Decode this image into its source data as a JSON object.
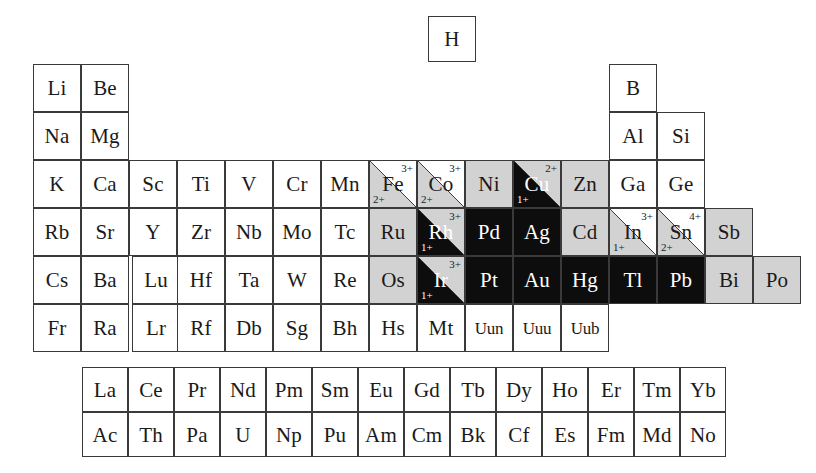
{
  "figure": {
    "kind": "periodic-table",
    "colors": {
      "white": "#ffffff",
      "gray": "#d2d2d2",
      "black": "#0d0d0d",
      "border": "#3a3a3a"
    },
    "legend_note": "Cells split on the diagonal show two oxidation states: upper-right label and lower-left label"
  },
  "geometry": {
    "cell_w": 48,
    "cell_h": 48,
    "col_x": [
      33,
      81,
      129,
      177,
      225,
      273,
      321,
      369,
      417,
      465,
      513,
      561,
      609,
      657,
      705,
      753
    ],
    "row_y": [
      64,
      112,
      160,
      208,
      256,
      304
    ],
    "lanth_x0": 82,
    "lanth_y0": 367,
    "lanth_cell_w": 46,
    "lanth_cell_h": 45,
    "hydrogen": {
      "x": 428,
      "y": 16,
      "w": 48,
      "h": 46
    }
  },
  "hydrogen": {
    "symbol": "H",
    "fill": "white"
  },
  "rows": [
    {
      "id": "row-2",
      "y_index": 0,
      "cells": [
        {
          "symbol": "Li",
          "col": 0,
          "fill": "white"
        },
        {
          "symbol": "Be",
          "col": 1,
          "fill": "white"
        },
        {
          "symbol": "B",
          "col": 12,
          "fill": "white"
        }
      ]
    },
    {
      "id": "row-3",
      "y_index": 1,
      "cells": [
        {
          "symbol": "Na",
          "col": 0,
          "fill": "white"
        },
        {
          "symbol": "Mg",
          "col": 1,
          "fill": "white"
        },
        {
          "symbol": "Al",
          "col": 12,
          "fill": "white"
        },
        {
          "symbol": "Si",
          "col": 13,
          "fill": "white"
        }
      ]
    },
    {
      "id": "row-4",
      "y_index": 2,
      "cells": [
        {
          "symbol": "K",
          "col": 0,
          "fill": "white"
        },
        {
          "symbol": "Ca",
          "col": 1,
          "fill": "white"
        },
        {
          "symbol": "Sc",
          "col": 2,
          "fill": "white"
        },
        {
          "symbol": "Ti",
          "col": 3,
          "fill": "white"
        },
        {
          "symbol": "V",
          "col": 4,
          "fill": "white"
        },
        {
          "symbol": "Cr",
          "col": 5,
          "fill": "white"
        },
        {
          "symbol": "Mn",
          "col": 6,
          "fill": "white"
        },
        {
          "symbol": "Fe",
          "col": 7,
          "fill": "split",
          "lower_fill": "gray",
          "upper_fill": "white",
          "charge_upper": "3+",
          "charge_lower": "2+"
        },
        {
          "symbol": "Co",
          "col": 8,
          "fill": "split",
          "lower_fill": "gray",
          "upper_fill": "white",
          "charge_upper": "3+",
          "charge_lower": "2+"
        },
        {
          "symbol": "Ni",
          "col": 9,
          "fill": "gray"
        },
        {
          "symbol": "Cu",
          "col": 10,
          "fill": "split",
          "lower_fill": "black",
          "upper_fill": "gray",
          "charge_upper": "2+",
          "charge_lower": "1+"
        },
        {
          "symbol": "Zn",
          "col": 11,
          "fill": "gray"
        },
        {
          "symbol": "Ga",
          "col": 12,
          "fill": "white"
        },
        {
          "symbol": "Ge",
          "col": 13,
          "fill": "white"
        }
      ]
    },
    {
      "id": "row-5",
      "y_index": 3,
      "cells": [
        {
          "symbol": "Rb",
          "col": 0,
          "fill": "white"
        },
        {
          "symbol": "Sr",
          "col": 1,
          "fill": "white"
        },
        {
          "symbol": "Y",
          "col": 2,
          "fill": "white"
        },
        {
          "symbol": "Zr",
          "col": 3,
          "fill": "white"
        },
        {
          "symbol": "Nb",
          "col": 4,
          "fill": "white"
        },
        {
          "symbol": "Mo",
          "col": 5,
          "fill": "white"
        },
        {
          "symbol": "Tc",
          "col": 6,
          "fill": "white"
        },
        {
          "symbol": "Ru",
          "col": 7,
          "fill": "gray"
        },
        {
          "symbol": "Rh",
          "col": 8,
          "fill": "split",
          "lower_fill": "black",
          "upper_fill": "gray",
          "charge_upper": "3+",
          "charge_lower": "1+"
        },
        {
          "symbol": "Pd",
          "col": 9,
          "fill": "black"
        },
        {
          "symbol": "Ag",
          "col": 10,
          "fill": "black"
        },
        {
          "symbol": "Cd",
          "col": 11,
          "fill": "gray"
        },
        {
          "symbol": "In",
          "col": 12,
          "fill": "split",
          "lower_fill": "gray",
          "upper_fill": "white",
          "charge_upper": "3+",
          "charge_lower": "1+"
        },
        {
          "symbol": "Sn",
          "col": 13,
          "fill": "split",
          "lower_fill": "gray",
          "upper_fill": "white",
          "charge_upper": "4+",
          "charge_lower": "2+"
        },
        {
          "symbol": "Sb",
          "col": 14,
          "fill": "gray"
        }
      ]
    },
    {
      "id": "row-6",
      "y_index": 4,
      "cells": [
        {
          "symbol": "Cs",
          "col": 0,
          "fill": "white"
        },
        {
          "symbol": "Ba",
          "col": 1,
          "fill": "white"
        },
        {
          "symbol": "Lu",
          "col": 2,
          "fill": "white",
          "gap_before": true
        },
        {
          "symbol": "Hf",
          "col": 3,
          "fill": "white"
        },
        {
          "symbol": "Ta",
          "col": 4,
          "fill": "white"
        },
        {
          "symbol": "W",
          "col": 5,
          "fill": "white"
        },
        {
          "symbol": "Re",
          "col": 6,
          "fill": "white"
        },
        {
          "symbol": "Os",
          "col": 7,
          "fill": "gray"
        },
        {
          "symbol": "Ir",
          "col": 8,
          "fill": "split",
          "lower_fill": "black",
          "upper_fill": "gray",
          "charge_upper": "3+",
          "charge_lower": "1+"
        },
        {
          "symbol": "Pt",
          "col": 9,
          "fill": "black"
        },
        {
          "symbol": "Au",
          "col": 10,
          "fill": "black"
        },
        {
          "symbol": "Hg",
          "col": 11,
          "fill": "black"
        },
        {
          "symbol": "Tl",
          "col": 12,
          "fill": "black"
        },
        {
          "symbol": "Pb",
          "col": 13,
          "fill": "black"
        },
        {
          "symbol": "Bi",
          "col": 14,
          "fill": "gray"
        },
        {
          "symbol": "Po",
          "col": 15,
          "fill": "gray"
        }
      ]
    },
    {
      "id": "row-7",
      "y_index": 5,
      "cells": [
        {
          "symbol": "Fr",
          "col": 0,
          "fill": "white"
        },
        {
          "symbol": "Ra",
          "col": 1,
          "fill": "white"
        },
        {
          "symbol": "Lr",
          "col": 2,
          "fill": "white",
          "gap_before": true
        },
        {
          "symbol": "Rf",
          "col": 3,
          "fill": "white"
        },
        {
          "symbol": "Db",
          "col": 4,
          "fill": "white"
        },
        {
          "symbol": "Sg",
          "col": 5,
          "fill": "white"
        },
        {
          "symbol": "Bh",
          "col": 6,
          "fill": "white"
        },
        {
          "symbol": "Hs",
          "col": 7,
          "fill": "white"
        },
        {
          "symbol": "Mt",
          "col": 8,
          "fill": "white"
        },
        {
          "symbol": "Uun",
          "col": 9,
          "fill": "white",
          "narrow": true
        },
        {
          "symbol": "Uuu",
          "col": 10,
          "fill": "white",
          "narrow": true
        },
        {
          "symbol": "Uub",
          "col": 11,
          "fill": "white",
          "narrow": true
        }
      ]
    }
  ],
  "lanthanides": {
    "id": "lanthanide-row",
    "cells": [
      {
        "symbol": "La"
      },
      {
        "symbol": "Ce"
      },
      {
        "symbol": "Pr"
      },
      {
        "symbol": "Nd"
      },
      {
        "symbol": "Pm"
      },
      {
        "symbol": "Sm"
      },
      {
        "symbol": "Eu"
      },
      {
        "symbol": "Gd"
      },
      {
        "symbol": "Tb"
      },
      {
        "symbol": "Dy"
      },
      {
        "symbol": "Ho"
      },
      {
        "symbol": "Er"
      },
      {
        "symbol": "Tm"
      },
      {
        "symbol": "Yb"
      }
    ]
  },
  "actinides": {
    "id": "actinide-row",
    "cells": [
      {
        "symbol": "Ac"
      },
      {
        "symbol": "Th"
      },
      {
        "symbol": "Pa"
      },
      {
        "symbol": "U"
      },
      {
        "symbol": "Np"
      },
      {
        "symbol": "Pu"
      },
      {
        "symbol": "Am"
      },
      {
        "symbol": "Cm"
      },
      {
        "symbol": "Bk"
      },
      {
        "symbol": "Cf"
      },
      {
        "symbol": "Es"
      },
      {
        "symbol": "Fm"
      },
      {
        "symbol": "Md"
      },
      {
        "symbol": "No"
      }
    ]
  }
}
